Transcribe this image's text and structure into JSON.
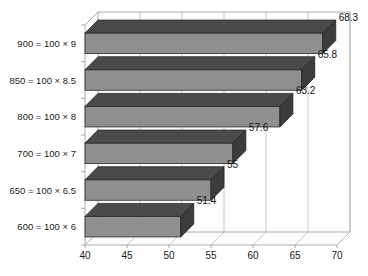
{
  "chart_data": {
    "type": "bar",
    "orientation": "horizontal",
    "title": "",
    "xlabel": "",
    "ylabel": "",
    "xlim": [
      40,
      70
    ],
    "xticks": [
      40,
      45,
      50,
      55,
      60,
      65,
      70
    ],
    "grid": true,
    "legend": "none",
    "style": "3d-bar",
    "categories": [
      "900 = 100 × 9",
      "850 = 100 × 8.5",
      "800 = 100 × 8",
      "700 = 100 × 7",
      "650 = 100 × 6.5",
      "600 = 100 × 6"
    ],
    "values": [
      68.3,
      65.8,
      63.2,
      57.6,
      55,
      51.4
    ],
    "value_labels": [
      "68.3",
      "65.8",
      "63.2",
      "57.6",
      "55",
      "51.4"
    ],
    "tick_labels": [
      "40",
      "45",
      "50",
      "55",
      "60",
      "65",
      "70"
    ],
    "colors": {
      "bar_face": "#8f8f8f",
      "bar_top": "#4a4a4a",
      "bar_cap": "#3c3c3c",
      "background": "#ffffff",
      "grid": "#b6b6b6",
      "axis": "#9a9a9a",
      "text": "#1c1c1c"
    }
  }
}
